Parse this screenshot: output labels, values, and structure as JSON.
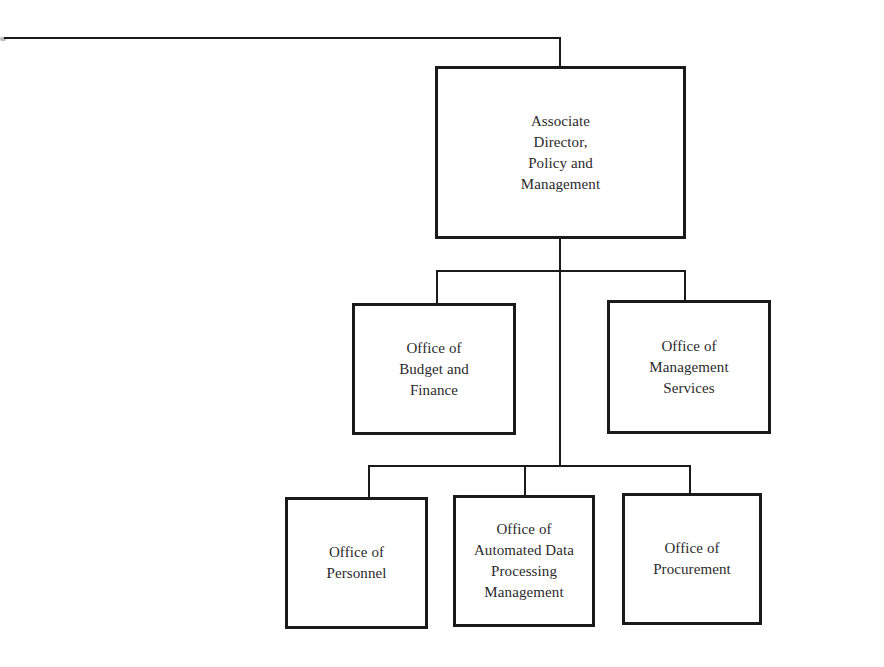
{
  "chart": {
    "root": {
      "label": "Associate\nDirector,\nPolicy and\nManagement"
    },
    "row1": [
      {
        "label": "Office of\nBudget and\nFinance"
      },
      {
        "label": "Office of\nManagement\nServices"
      }
    ],
    "row2": [
      {
        "label": "Office of\nPersonnel"
      },
      {
        "label": "Office of\nAutomated Data\nProcessing\nManagement"
      },
      {
        "label": "Office of\nProcurement"
      }
    ]
  },
  "colors": {
    "line": "#1a1a1a",
    "background": "#ffffff",
    "text": "#2a2a2a"
  }
}
